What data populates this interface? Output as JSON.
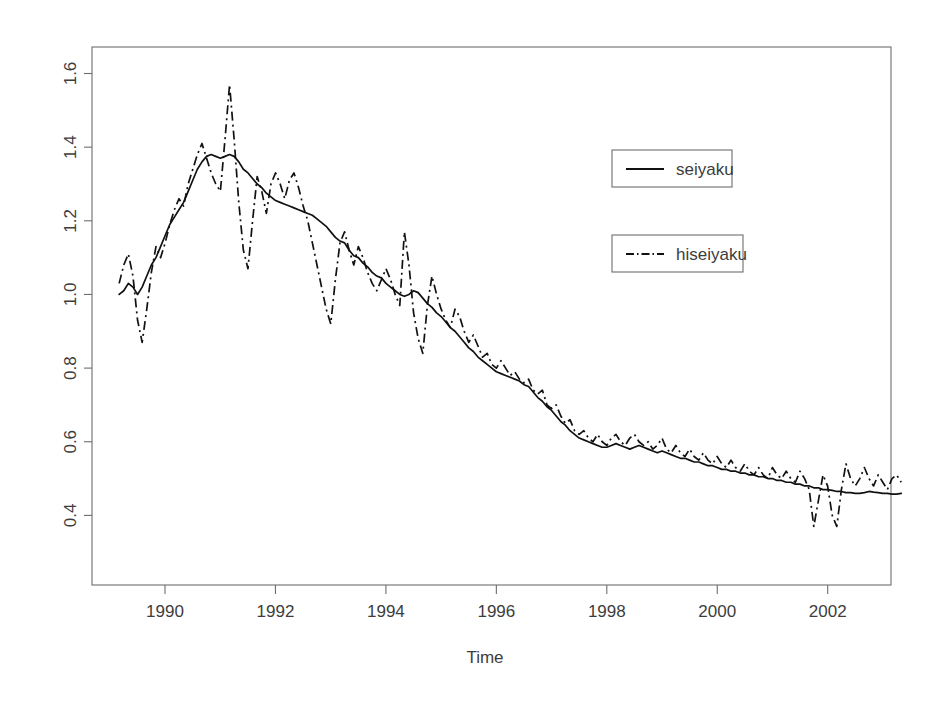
{
  "chart_data": {
    "type": "line",
    "title": "",
    "xlabel": "Time",
    "ylabel": "",
    "xlim": [
      1989.15,
      1989.15
    ],
    "ylim": [
      0.33,
      1.63
    ],
    "grid": false,
    "legend_position": "upper-right-inside",
    "x_ticks": [
      "1990",
      "1992",
      "1994",
      "1996",
      "1998",
      "2000",
      "2002"
    ],
    "x_tick_values": [
      1990,
      1992,
      1994,
      1996,
      1998,
      2000,
      2002
    ],
    "y_ticks": [
      "0.4",
      "0.6",
      "0.8",
      "1.0",
      "1.2",
      "1.4",
      "1.6"
    ],
    "y_tick_values": [
      0.4,
      0.6,
      0.8,
      1.0,
      1.2,
      1.4,
      1.6
    ],
    "x_start": 1989.17,
    "x_step": 0.0833,
    "series": [
      {
        "name": "seiyaku",
        "style": "solid",
        "values": [
          1.0,
          1.01,
          1.03,
          1.02,
          1.0,
          1.02,
          1.05,
          1.08,
          1.1,
          1.13,
          1.16,
          1.19,
          1.21,
          1.23,
          1.25,
          1.28,
          1.31,
          1.34,
          1.36,
          1.375,
          1.38,
          1.375,
          1.37,
          1.375,
          1.38,
          1.375,
          1.36,
          1.34,
          1.33,
          1.315,
          1.3,
          1.29,
          1.275,
          1.265,
          1.255,
          1.25,
          1.245,
          1.24,
          1.235,
          1.23,
          1.225,
          1.22,
          1.215,
          1.205,
          1.195,
          1.185,
          1.17,
          1.155,
          1.145,
          1.14,
          1.12,
          1.105,
          1.1,
          1.085,
          1.075,
          1.06,
          1.05,
          1.045,
          1.03,
          1.02,
          1.01,
          1.0,
          0.995,
          1.0,
          1.01,
          1.005,
          0.99,
          0.975,
          0.965,
          0.95,
          0.94,
          0.925,
          0.91,
          0.9,
          0.885,
          0.87,
          0.855,
          0.845,
          0.83,
          0.82,
          0.81,
          0.8,
          0.79,
          0.785,
          0.78,
          0.775,
          0.77,
          0.765,
          0.755,
          0.75,
          0.735,
          0.72,
          0.71,
          0.695,
          0.685,
          0.67,
          0.655,
          0.645,
          0.63,
          0.62,
          0.61,
          0.605,
          0.6,
          0.595,
          0.59,
          0.585,
          0.585,
          0.59,
          0.595,
          0.59,
          0.585,
          0.58,
          0.585,
          0.59,
          0.585,
          0.58,
          0.575,
          0.57,
          0.575,
          0.57,
          0.565,
          0.56,
          0.555,
          0.555,
          0.55,
          0.545,
          0.545,
          0.54,
          0.535,
          0.535,
          0.53,
          0.525,
          0.525,
          0.52,
          0.52,
          0.515,
          0.515,
          0.51,
          0.51,
          0.505,
          0.505,
          0.5,
          0.5,
          0.495,
          0.495,
          0.49,
          0.49,
          0.485,
          0.485,
          0.48,
          0.48,
          0.475,
          0.475,
          0.47,
          0.47,
          0.468,
          0.465,
          0.465,
          0.462,
          0.462,
          0.46,
          0.46,
          0.462,
          0.465,
          0.463,
          0.462,
          0.46,
          0.46,
          0.458,
          0.458,
          0.46
        ]
      },
      {
        "name": "hiseiyaku",
        "style": "dash-dot",
        "values": [
          1.03,
          1.08,
          1.11,
          1.05,
          0.93,
          0.87,
          0.96,
          1.06,
          1.13,
          1.1,
          1.14,
          1.19,
          1.23,
          1.26,
          1.24,
          1.3,
          1.34,
          1.38,
          1.41,
          1.37,
          1.33,
          1.3,
          1.28,
          1.42,
          1.57,
          1.42,
          1.25,
          1.12,
          1.07,
          1.2,
          1.32,
          1.28,
          1.22,
          1.3,
          1.33,
          1.3,
          1.26,
          1.31,
          1.33,
          1.29,
          1.24,
          1.2,
          1.14,
          1.08,
          1.02,
          0.96,
          0.92,
          1.04,
          1.14,
          1.17,
          1.12,
          1.08,
          1.13,
          1.1,
          1.06,
          1.03,
          1.01,
          1.04,
          1.07,
          1.04,
          1.0,
          0.97,
          1.17,
          1.08,
          0.95,
          0.88,
          0.84,
          0.97,
          1.05,
          1.0,
          0.96,
          0.93,
          0.91,
          0.96,
          0.94,
          0.9,
          0.87,
          0.89,
          0.86,
          0.83,
          0.84,
          0.81,
          0.8,
          0.82,
          0.8,
          0.78,
          0.79,
          0.77,
          0.76,
          0.77,
          0.74,
          0.73,
          0.74,
          0.7,
          0.69,
          0.7,
          0.67,
          0.65,
          0.66,
          0.63,
          0.62,
          0.63,
          0.61,
          0.6,
          0.62,
          0.6,
          0.59,
          0.61,
          0.62,
          0.6,
          0.59,
          0.61,
          0.62,
          0.6,
          0.59,
          0.6,
          0.58,
          0.59,
          0.61,
          0.58,
          0.57,
          0.59,
          0.57,
          0.56,
          0.58,
          0.56,
          0.55,
          0.57,
          0.55,
          0.54,
          0.56,
          0.54,
          0.53,
          0.55,
          0.53,
          0.52,
          0.54,
          0.52,
          0.51,
          0.53,
          0.51,
          0.5,
          0.53,
          0.51,
          0.5,
          0.52,
          0.5,
          0.49,
          0.52,
          0.5,
          0.47,
          0.37,
          0.44,
          0.51,
          0.48,
          0.4,
          0.37,
          0.47,
          0.54,
          0.5,
          0.48,
          0.5,
          0.53,
          0.5,
          0.48,
          0.51,
          0.49,
          0.47,
          0.5,
          0.51,
          0.49
        ]
      }
    ]
  },
  "legend": {
    "entries": [
      {
        "label": "seiyaku",
        "style": "solid"
      },
      {
        "label": "hiseiyaku",
        "style": "dash-dot"
      }
    ]
  },
  "axes": {
    "x_title": "Time"
  }
}
